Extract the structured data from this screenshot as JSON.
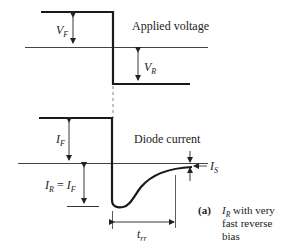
{
  "voltage_panel": {
    "title": "Applied voltage",
    "forward_label": "V",
    "forward_sub": "F",
    "reverse_label": "V",
    "reverse_sub": "R"
  },
  "current_panel": {
    "title": "Diode current",
    "forward_label": "I",
    "forward_sub": "F",
    "reverse_label_lhs": "I",
    "reverse_label_lhs_sub": "R",
    "reverse_label_eq": " = ",
    "reverse_label_rhs": "I",
    "reverse_label_rhs_sub": "F",
    "saturation_label": "I",
    "saturation_sub": "S",
    "recovery_label": "t",
    "recovery_sub": "rr"
  },
  "caption": {
    "tag": "(a)",
    "symbol": "I",
    "symbol_sub": "R",
    "line1": " with very",
    "line2": "fast reverse",
    "line3": "bias"
  },
  "colors": {
    "stroke": "#1a1a1a",
    "thin": "#333333",
    "background": "#ffffff"
  }
}
